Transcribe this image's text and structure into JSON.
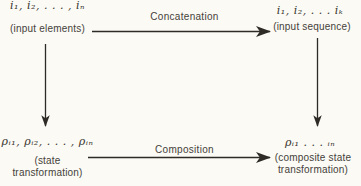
{
  "page": {
    "background": "#fbfaf5",
    "ink": "#2e2b27"
  },
  "nodes": {
    "input_elements": {
      "math": "i₁, i₂, . . . , iₙ",
      "label": "(input elements)"
    },
    "input_sequence": {
      "math": "i₁, i₂, . . . iₖ",
      "label": "(input sequence)"
    },
    "state_transformation": {
      "math": "ρᵢ₁, ρᵢ₂, . . . , ρᵢₙ",
      "label_line1": "(state",
      "label_line2": "transformation)"
    },
    "composite_state_transformation": {
      "math": "ρᵢ₁ . . . ᵢₙ",
      "label_line1": "(composite state",
      "label_line2": "transformation)"
    }
  },
  "arrows": {
    "concatenation": {
      "label": "Concatenation"
    },
    "composition": {
      "label": "Composition"
    }
  }
}
